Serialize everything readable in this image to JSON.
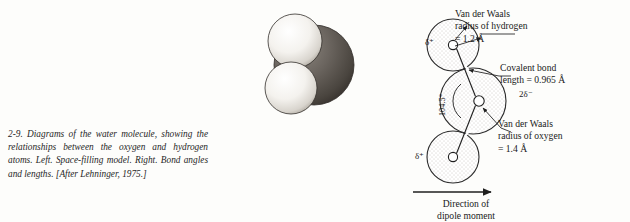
{
  "figure": {
    "number": "2-9.",
    "caption": "Diagrams of the water molecule, showing the relationships between the oxygen and hydrogen atoms.  Left.  Space-filling model.  Right.  Bond angles and lengths. [After Lehninger, 1975.]"
  },
  "space_filling": {
    "name": "space-filling-model",
    "atoms": [
      {
        "label": "hydrogen-upper",
        "fill": "#f2f0ec"
      },
      {
        "label": "hydrogen-lower",
        "fill": "#f2f0ec"
      },
      {
        "label": "oxygen",
        "fill": "#5f5a55"
      }
    ]
  },
  "vdw_diagram": {
    "labels": {
      "vdw_hydrogen": "Van der Waals\nradius of hydrogen\n= 1.2 Å",
      "covalent_bond": "Covalent bond\nlength = 0.965 Å",
      "vdw_oxygen": "Van der Waals\nradius of oxygen\n= 1.4 Å",
      "dipole": "Direction of\ndipole moment",
      "delta_plus": "δ⁺",
      "delta_minus": "δ⁻",
      "delta_2minus": "2δ⁻",
      "bond_angle": "104.5°"
    },
    "atom_letters": {
      "hydrogen_top": "H",
      "hydrogen_bottom": "H",
      "oxygen": "O"
    },
    "colors": {
      "outline": "#2b2b2b",
      "shading": "#b9b3aa",
      "text": "#1a1a1a"
    }
  }
}
